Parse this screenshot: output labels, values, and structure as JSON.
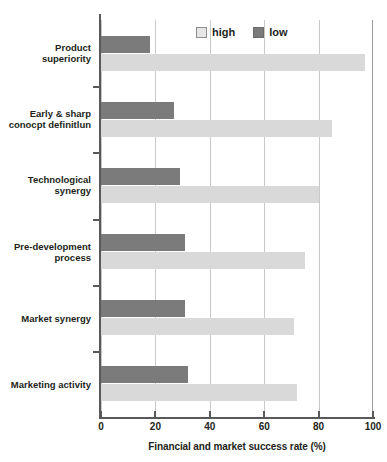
{
  "chart_data": {
    "type": "bar",
    "orientation": "horizontal",
    "title": "",
    "xlabel": "Financial and market success rate (%)",
    "ylabel": "",
    "xlim": [
      0,
      100
    ],
    "xticks": [
      0,
      20,
      40,
      60,
      80,
      100
    ],
    "xtick_labels": [
      "0",
      "20",
      "40",
      "60",
      "80",
      "100"
    ],
    "grid": "vertical",
    "legend_position": "top-center",
    "categories": [
      "Product superiority",
      "Early & sharp conocpt definitlun",
      "Technological synergy",
      "Pre-development process",
      "Market synergy",
      "Marketing activity"
    ],
    "category_lines": [
      [
        "Product",
        "superiority"
      ],
      [
        "Early & sharp",
        "conocpt definitlun"
      ],
      [
        "Technological",
        "synergy"
      ],
      [
        "Pre-development",
        "process"
      ],
      [
        "Market synergy"
      ],
      [
        "Marketing activity"
      ]
    ],
    "series": [
      {
        "name": "high",
        "color": "#d9d9d9",
        "values": [
          97,
          85,
          80,
          75,
          71,
          72
        ]
      },
      {
        "name": "low",
        "color": "#7b7b7b",
        "values": [
          18,
          27,
          29,
          31,
          31,
          32
        ]
      }
    ]
  },
  "legend": {
    "items": [
      {
        "label": "high",
        "swatch": "high-swatch"
      },
      {
        "label": "low",
        "swatch": "low-swatch"
      }
    ]
  },
  "axis": {
    "x_title": "Financial and market success rate (%)"
  }
}
